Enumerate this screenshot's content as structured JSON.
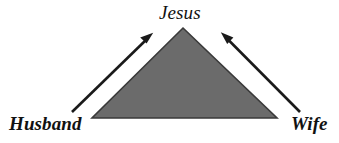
{
  "diagram": {
    "type": "triangle-relationship-diagram",
    "background_color": "#ffffff",
    "shape": {
      "name": "triangle",
      "fill_color": "#6b6b6b",
      "stroke_color": "#3a3a3a",
      "apex": {
        "x": 183,
        "y": 28
      },
      "bottom_left": {
        "x": 92,
        "y": 118
      },
      "bottom_right": {
        "x": 277,
        "y": 118
      }
    },
    "labels": {
      "apex": "Jesus",
      "left": "Husband",
      "right": "Wife"
    },
    "arrows": [
      {
        "name": "husband-to-jesus-arrow",
        "color": "#1a1a1a",
        "from": {
          "x": 72,
          "y": 112
        },
        "to": {
          "x": 152,
          "y": 34
        },
        "direction": "up-right"
      },
      {
        "name": "wife-to-jesus-arrow",
        "color": "#1a1a1a",
        "from": {
          "x": 300,
          "y": 112
        },
        "to": {
          "x": 222,
          "y": 33
        },
        "direction": "up-left"
      }
    ]
  }
}
